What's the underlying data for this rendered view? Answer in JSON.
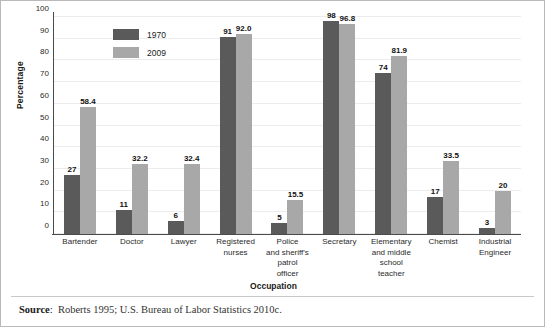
{
  "chart_data": {
    "type": "bar",
    "title": "",
    "xlabel": "Occupation",
    "ylabel": "Percentage",
    "ylim": [
      0,
      100
    ],
    "yticks": [
      0,
      10,
      20,
      30,
      40,
      50,
      60,
      70,
      80,
      90,
      100
    ],
    "grid": true,
    "legend_position": "inside-top-left",
    "categories": [
      "Bartender",
      "Doctor",
      "Lawyer",
      "Registered nurses",
      "Police and sheriff's patrol officer",
      "Secretary",
      "Elementary and middle school teacher",
      "Chemist",
      "Industrial Engineer"
    ],
    "category_lines": [
      [
        "Bartender"
      ],
      [
        "Doctor"
      ],
      [
        "Lawyer"
      ],
      [
        "Registered",
        "nurses"
      ],
      [
        "Police",
        "and sheriff's",
        "patrol",
        "officer"
      ],
      [
        "Secretary"
      ],
      [
        "Elementary",
        "and middle",
        "school",
        "teacher"
      ],
      [
        "Chemist"
      ],
      [
        "Industrial",
        "Engineer"
      ]
    ],
    "series": [
      {
        "name": "1970",
        "color": "#5a5a5a",
        "values": [
          27,
          11,
          6,
          91,
          5,
          98,
          74,
          17,
          3
        ],
        "labels": [
          "27",
          "11",
          "6",
          "91",
          "5",
          "98",
          "74",
          "17",
          "3"
        ]
      },
      {
        "name": "2009",
        "color": "#a8a8a8",
        "values": [
          58.4,
          32.2,
          32.4,
          92.0,
          15.5,
          96.8,
          81.9,
          33.5,
          20
        ],
        "labels": [
          "58.4",
          "32.2",
          "32.4",
          "92.0",
          "15.5",
          "96.8",
          "81.9",
          "33.5",
          "20"
        ]
      }
    ]
  },
  "footer": {
    "source_label": "Source",
    "source_separator": ":",
    "source_text": "Roberts 1995; U.S. Bureau of Labor Statistics 2010c."
  }
}
